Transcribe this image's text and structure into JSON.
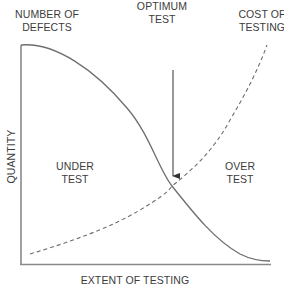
{
  "diagram": {
    "title_labels": {
      "defects": [
        "NUMBER OF",
        "DEFECTS"
      ],
      "optimum": [
        "OPTIMUM",
        "TEST"
      ],
      "cost": [
        "COST OF",
        "TESTING"
      ]
    },
    "region_labels": {
      "under": [
        "UNDER",
        "TEST"
      ],
      "over": [
        "OVER",
        "TEST"
      ]
    },
    "axes": {
      "x_label": "EXTENT OF TESTING",
      "y_label": "QUANTITY"
    },
    "curves": [
      {
        "name": "Number of defects",
        "style": "solid",
        "trend": "decreasing"
      },
      {
        "name": "Cost of testing",
        "style": "dashed",
        "trend": "increasing"
      }
    ],
    "annotation": {
      "arrow_target": "intersection of curves",
      "label": "OPTIMUM TEST"
    },
    "colors": {
      "line": "#6e6e6e",
      "axis": "#8a8a8a",
      "text": "#3c3c3c"
    }
  }
}
